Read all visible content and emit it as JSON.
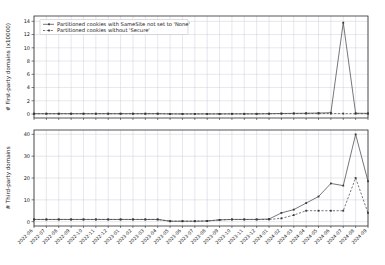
{
  "figure": {
    "title": "",
    "background": "#ffffff",
    "grid_color": "#c9c9d6",
    "line_color": "#4a4a4a"
  },
  "legend": {
    "position": "upper-left-top-panel",
    "entries": [
      {
        "label": "Partitioned cookies with SameSite not set to 'None'",
        "style": "solid"
      },
      {
        "label": "Partitioned cookies without 'Secure'",
        "style": "dashed"
      }
    ]
  },
  "chart_data": [
    {
      "type": "line",
      "panel": "top",
      "title": "",
      "xlabel": "",
      "ylabel": "# First-party domains (x10000)",
      "ylim": [
        -0.6,
        14.8
      ],
      "yticks": [
        0,
        2,
        4,
        6,
        8,
        10,
        12,
        14
      ],
      "ytick_labels": [
        "0",
        "2",
        "4",
        "6",
        "8",
        "10",
        "12",
        "14"
      ],
      "grid": true,
      "legend": [
        "Partitioned cookies with SameSite not set to 'None'",
        "Partitioned cookies without 'Secure'"
      ],
      "x": [
        "2022-06",
        "2022-07",
        "2022-08",
        "2022-09",
        "2022-10",
        "2022-11",
        "2022-12",
        "2023-01",
        "2023-02",
        "2023-03",
        "2023-04",
        "2023-05",
        "2023-06",
        "2023-07",
        "2023-08",
        "2023-09",
        "2023-10",
        "2023-11",
        "2023-12",
        "2024-01",
        "2024-02",
        "2024-03",
        "2024-04",
        "2024-05",
        "2024-06",
        "2024-07",
        "2024-08",
        "2024-09"
      ],
      "series": [
        {
          "name": "Partitioned cookies with SameSite not set to 'None'",
          "style": "solid",
          "values": [
            0.05,
            0.05,
            0.05,
            0.05,
            0.05,
            0.05,
            0.05,
            0.05,
            0.05,
            0.05,
            0.05,
            0.02,
            0.02,
            0.02,
            0.02,
            0.02,
            0.03,
            0.03,
            0.03,
            0.05,
            0.08,
            0.1,
            0.12,
            0.15,
            0.2,
            13.8,
            0.12,
            0.1
          ]
        },
        {
          "name": "Partitioned cookies without 'Secure'",
          "style": "dashed",
          "values": [
            0.05,
            0.05,
            0.05,
            0.05,
            0.05,
            0.05,
            0.05,
            0.05,
            0.05,
            0.05,
            0.05,
            0.02,
            0.02,
            0.02,
            0.02,
            0.02,
            0.03,
            0.03,
            0.03,
            0.05,
            0.06,
            0.07,
            0.07,
            0.07,
            0.07,
            0.07,
            0.05,
            0.05
          ]
        }
      ]
    },
    {
      "type": "line",
      "panel": "bottom",
      "title": "",
      "xlabel": "",
      "ylabel": "# Third-party domains",
      "ylim": [
        -2,
        42
      ],
      "yticks": [
        0,
        10,
        20,
        30,
        40
      ],
      "ytick_labels": [
        "0",
        "10",
        "20",
        "30",
        "40"
      ],
      "grid": true,
      "x": [
        "2022-06",
        "2022-07",
        "2022-08",
        "2022-09",
        "2022-10",
        "2022-11",
        "2022-12",
        "2023-01",
        "2023-02",
        "2023-03",
        "2023-04",
        "2023-05",
        "2023-06",
        "2023-07",
        "2023-08",
        "2023-09",
        "2023-10",
        "2023-11",
        "2023-12",
        "2024-01",
        "2024-02",
        "2024-03",
        "2024-04",
        "2024-05",
        "2024-06",
        "2024-07",
        "2024-08",
        "2024-09"
      ],
      "series": [
        {
          "name": "Partitioned cookies with SameSite not set to 'None'",
          "style": "solid",
          "values": [
            1,
            1,
            1,
            1,
            1,
            1,
            1,
            1,
            1,
            1,
            1,
            0.2,
            0.2,
            0.2,
            0.3,
            0.8,
            1,
            1,
            1,
            1.2,
            4,
            5.5,
            8.5,
            11.5,
            17.5,
            16.5,
            40,
            18.5,
            16.5
          ]
        },
        {
          "name": "Partitioned cookies without 'Secure'",
          "style": "dashed",
          "values": [
            1,
            1,
            1,
            1,
            1,
            1,
            1,
            1,
            1,
            1,
            1,
            0.2,
            0.2,
            0.2,
            0.3,
            0.8,
            1,
            1,
            1,
            1,
            1.5,
            3,
            5,
            5,
            5,
            5,
            20,
            4,
            4
          ]
        }
      ]
    }
  ]
}
